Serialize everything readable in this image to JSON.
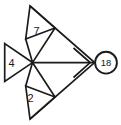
{
  "diagram": {
    "background_color": "#ffffff",
    "line_color": "#1b1b1b",
    "shapes": {
      "top_triangle": {
        "label": "7"
      },
      "left_triangle": {
        "label": "4"
      },
      "bottom_triangle": {
        "label": "2"
      },
      "result_circle": {
        "label": "18"
      }
    }
  }
}
